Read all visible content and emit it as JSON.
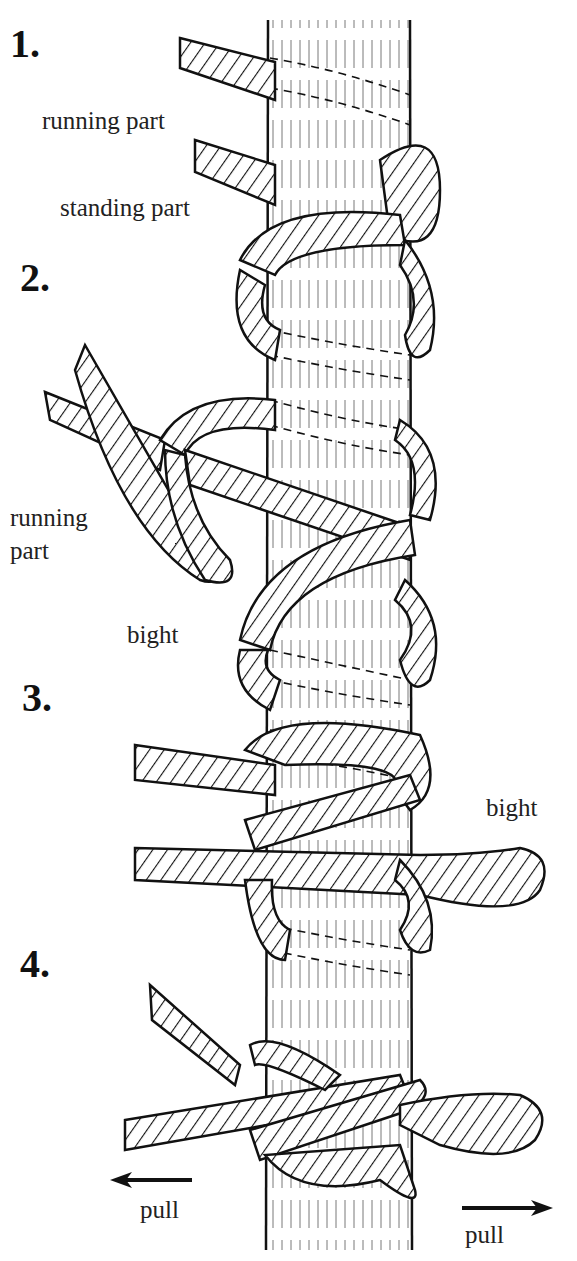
{
  "diagram": {
    "type": "knot-tying instructions",
    "steps": [
      {
        "number": "1.",
        "labels": [
          "running part",
          "standing part"
        ]
      },
      {
        "number": "2.",
        "labels": [
          "running part",
          "bight"
        ]
      },
      {
        "number": "3.",
        "labels": [
          "bight"
        ]
      },
      {
        "number": "4.",
        "labels": [
          "pull",
          "pull"
        ]
      }
    ],
    "text": {
      "step1": "1.",
      "step2": "2.",
      "step3": "3.",
      "step4": "4.",
      "running_part_1": "running part",
      "standing_part": "standing part",
      "running_part_2a": "running",
      "running_part_2b": "part",
      "bight_2": "bight",
      "bight_3": "bight",
      "pull_left": "pull",
      "pull_right": "pull"
    },
    "colors": {
      "ink": "#111111",
      "paper": "#ffffff"
    }
  }
}
